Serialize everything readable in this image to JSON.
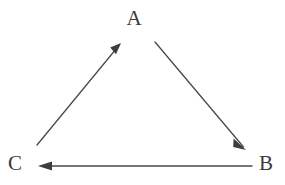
{
  "diagram": {
    "type": "directed-graph",
    "title": "",
    "background_color": "#ffffff",
    "stroke_color": "#4a4a4a",
    "label_color": "#3a3a3a",
    "nodes": [
      {
        "id": "A",
        "label": "A",
        "x": 134,
        "y": 20
      },
      {
        "id": "C",
        "label": "C",
        "x": 15,
        "y": 165
      },
      {
        "id": "B",
        "label": "B",
        "x": 265,
        "y": 165
      }
    ],
    "edges": [
      {
        "id": "c-to-a",
        "from": "C",
        "to": "A",
        "label": "",
        "directed": true,
        "x1": 37,
        "y1": 145,
        "x2": 121,
        "y2": 44
      },
      {
        "id": "a-to-b",
        "from": "A",
        "to": "B",
        "label": "",
        "directed": true,
        "x1": 155,
        "y1": 42,
        "x2": 246,
        "y2": 150
      },
      {
        "id": "b-to-c",
        "from": "B",
        "to": "C",
        "label": "",
        "directed": true,
        "x1": 252,
        "y1": 166,
        "x2": 38,
        "y2": 166
      }
    ]
  }
}
